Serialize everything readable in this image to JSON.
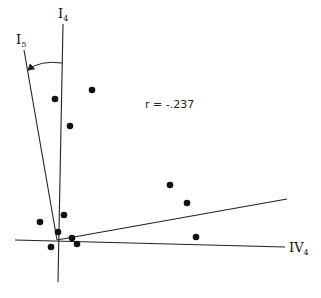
{
  "chart_data": {
    "type": "scatter",
    "title": "",
    "annotation": "r = -.237",
    "axes": [
      {
        "name": "I4",
        "label_main": "I",
        "label_sub": "4",
        "x1": 63,
        "y1": 24,
        "x2": 58,
        "y2": 282
      },
      {
        "name": "I5",
        "label_main": "I",
        "label_sub": "5",
        "x1": 24,
        "y1": 50,
        "x2": 57,
        "y2": 240
      },
      {
        "name": "IV4",
        "label_main": "IV",
        "label_sub": "4",
        "x1": 15,
        "y1": 240,
        "x2": 285,
        "y2": 247
      },
      {
        "name": "rotated",
        "label_main": "",
        "label_sub": "",
        "x1": 57,
        "y1": 240,
        "x2": 287,
        "y2": 199
      }
    ],
    "rotation_arc": {
      "from": "I4",
      "to": "I5",
      "direction": "counterclockwise"
    },
    "points": [
      {
        "x": 92,
        "y": 90
      },
      {
        "x": 55,
        "y": 99
      },
      {
        "x": 70,
        "y": 126
      },
      {
        "x": 170,
        "y": 185
      },
      {
        "x": 187,
        "y": 203
      },
      {
        "x": 196,
        "y": 237
      },
      {
        "x": 40,
        "y": 222
      },
      {
        "x": 64,
        "y": 215
      },
      {
        "x": 58,
        "y": 232
      },
      {
        "x": 72,
        "y": 238
      },
      {
        "x": 77,
        "y": 244
      },
      {
        "x": 51,
        "y": 247
      }
    ],
    "xlabel": "IV4",
    "ylabel": "I4",
    "grid": false,
    "legend": "none"
  },
  "labels": {
    "i4_main": "I",
    "i4_sub": "4",
    "i5_main": "I",
    "i5_sub": "5",
    "iv4_main": "IV",
    "iv4_sub": "4",
    "r_text": "r = -.237"
  }
}
